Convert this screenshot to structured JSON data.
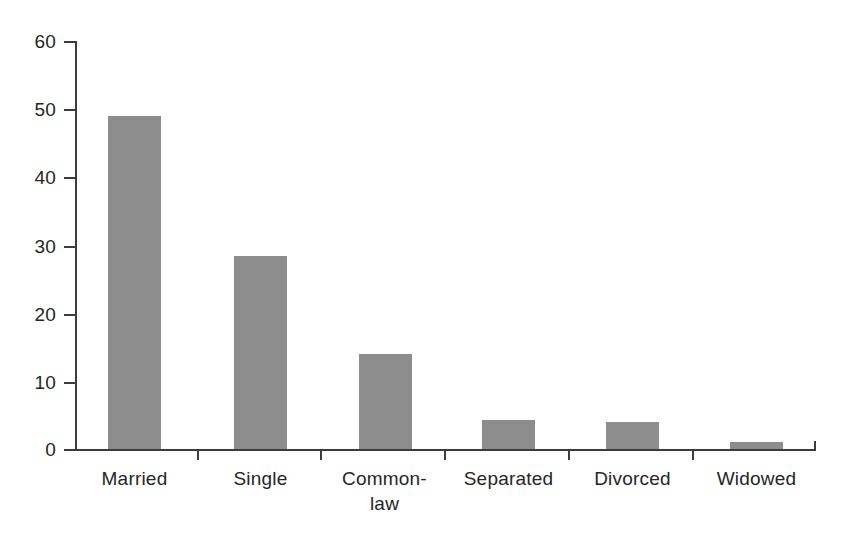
{
  "chart_data": {
    "type": "bar",
    "title": "",
    "subtitle": "",
    "xlabel": "",
    "ylabel": "",
    "categories": [
      "Married",
      "Single",
      "Common-\nlaw",
      "Separated",
      "Divorced",
      "Widowed"
    ],
    "values": [
      49,
      28.4,
      14,
      4.3,
      4,
      1
    ],
    "ylim": [
      0,
      60
    ],
    "yticks": [
      0,
      10,
      20,
      30,
      40,
      50,
      60
    ],
    "ytick_labels": [
      "0",
      "10",
      "20",
      "30",
      "40",
      "50",
      "60"
    ],
    "grid": false,
    "legend": null,
    "legend_position": "none",
    "series": [
      {
        "name": "",
        "values": [
          49,
          28.4,
          14,
          4.3,
          4,
          1
        ]
      }
    ],
    "bar_color": "#8d8d8d",
    "axis_color": "#3c3c3c",
    "background_color": "#ffffff",
    "text_color": "#262626"
  }
}
